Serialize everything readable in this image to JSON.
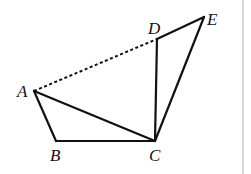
{
  "figure": {
    "type": "geometry-diagram",
    "points": {
      "A": {
        "label": "A",
        "x": 34,
        "y": 91
      },
      "B": {
        "label": "B",
        "x": 56,
        "y": 141
      },
      "C": {
        "label": "C",
        "x": 155,
        "y": 141
      },
      "D": {
        "label": "D",
        "x": 157,
        "y": 39
      },
      "E": {
        "label": "E",
        "x": 204,
        "y": 17
      }
    },
    "segments_solid": [
      "AB",
      "BC",
      "AC",
      "CD",
      "DE",
      "CE"
    ],
    "segments_dashed": [
      "AD"
    ],
    "colors": {
      "line": "#111111",
      "border": "#c8c8c8",
      "background": "#ffffff"
    }
  }
}
